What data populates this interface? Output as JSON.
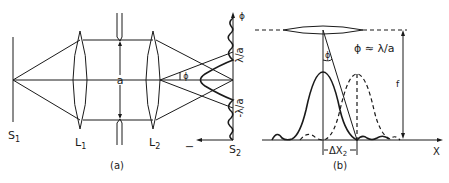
{
  "panel_a": {
    "caption": "(a)",
    "source_label": "S",
    "source_sub": "1",
    "lens1_label": "L",
    "lens1_sub": "1",
    "lens2_label": "L",
    "lens2_sub": "2",
    "screen_label": "S",
    "screen_sub": "2",
    "aperture_label": "a",
    "angle_label": "ϕ",
    "axis_phi_label": "ϕ",
    "intensity_label": "I",
    "tick_pos": "λ/a",
    "tick_neg": "-λ/a"
  },
  "panel_b": {
    "caption": "(b)",
    "relation": "ϕ ≈ λ/a",
    "angle_label": "ϕ",
    "focal_label": "f",
    "x_axis_label": "X",
    "delta_label": "ΔX",
    "delta_sub": "2"
  }
}
